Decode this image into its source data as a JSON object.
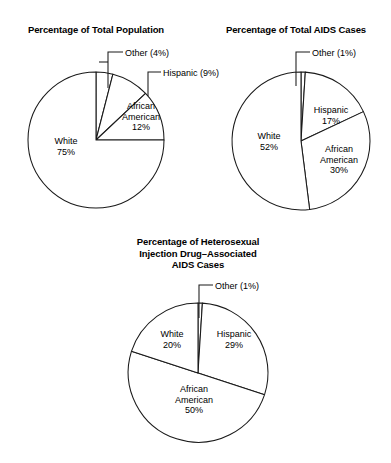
{
  "page": {
    "background_color": "#ffffff",
    "line_color": "#1a1a1a",
    "slice_fill_color": "#ffffff"
  },
  "chart_data": [
    {
      "type": "pie",
      "title": "Percentage of Total Population",
      "categories": [
        "Other",
        "Hispanic",
        "African American",
        "White"
      ],
      "values": [
        4,
        9,
        12,
        75
      ],
      "value_unit": "percent",
      "start_angle_deg": 0,
      "direction": "clockwise",
      "legend": "none",
      "grid": false,
      "labels": [
        {
          "name": "Other",
          "text": "Other (4%)",
          "placement": "callout"
        },
        {
          "name": "Hispanic",
          "text": "Hispanic (9%)",
          "placement": "callout"
        },
        {
          "name": "African American",
          "text": "African\nAmerican\n12%",
          "placement": "inside"
        },
        {
          "name": "White",
          "text": "White\n75%",
          "placement": "inside"
        }
      ]
    },
    {
      "type": "pie",
      "title": "Percentage of Total AIDS Cases",
      "categories": [
        "Other",
        "Hispanic",
        "African American",
        "White"
      ],
      "values": [
        1,
        17,
        30,
        52
      ],
      "value_unit": "percent",
      "start_angle_deg": 0,
      "direction": "clockwise",
      "legend": "none",
      "grid": false,
      "labels": [
        {
          "name": "Other",
          "text": "Other (1%)",
          "placement": "callout"
        },
        {
          "name": "Hispanic",
          "text": "Hispanic\n17%",
          "placement": "inside"
        },
        {
          "name": "African American",
          "text": "African\nAmerican\n30%",
          "placement": "inside"
        },
        {
          "name": "White",
          "text": "White\n52%",
          "placement": "inside"
        }
      ]
    },
    {
      "type": "pie",
      "title": "Percentage of Heterosexual\nInjection Drug–Associated\nAIDS Cases",
      "categories": [
        "Other",
        "Hispanic",
        "African American",
        "White"
      ],
      "values": [
        1,
        29,
        50,
        20
      ],
      "value_unit": "percent",
      "start_angle_deg": 0,
      "direction": "clockwise",
      "legend": "none",
      "grid": false,
      "labels": [
        {
          "name": "Other",
          "text": "Other (1%)",
          "placement": "callout"
        },
        {
          "name": "Hispanic",
          "text": "Hispanic\n29%",
          "placement": "inside"
        },
        {
          "name": "African American",
          "text": "African\nAmerican\n50%",
          "placement": "inside"
        },
        {
          "name": "White",
          "text": "White\n20%",
          "placement": "inside"
        }
      ]
    }
  ]
}
